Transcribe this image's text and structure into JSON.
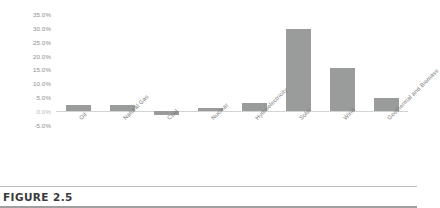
{
  "figure": {
    "caption": "FIGURE 2.5"
  },
  "chart_data": {
    "type": "bar",
    "title": "",
    "xlabel": "",
    "ylabel": "",
    "categories": [
      "Oil",
      "Natural Gas",
      "Coal",
      "Nuclear",
      "Hydroelectricity",
      "Solar",
      "Wind",
      "Geothermal and Biomass"
    ],
    "values": [
      2.2,
      2.2,
      -1.5,
      1.2,
      3.0,
      29.5,
      15.4,
      4.6
    ],
    "value_format": "percent",
    "ylim": [
      -5,
      35
    ],
    "ytick_labels": [
      "35.0%",
      "30.0%",
      "25.0%",
      "20.0%",
      "15.0%",
      "10.0%",
      "5.0%",
      "0.0%",
      "-5.0%"
    ],
    "ytick_values": [
      35,
      30,
      25,
      20,
      15,
      10,
      5,
      0,
      -5
    ],
    "grid": false,
    "legend": "none",
    "bar_color": "#9a9b9b",
    "axis_color": "#d3d3d3",
    "tick_label_color": "#8d8d8d"
  }
}
